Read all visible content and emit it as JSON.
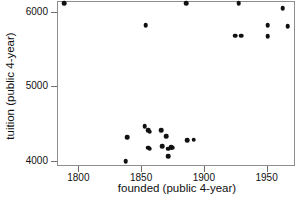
{
  "chart_data": {
    "type": "scatter",
    "title": "",
    "xlabel": "founded (public 4-year)",
    "ylabel": "tuition (public 4-year)",
    "xlim": [
      1783,
      1971
    ],
    "ylim": [
      3955,
      6145
    ],
    "xticks": [
      1800,
      1850,
      1900,
      1950
    ],
    "xtick_labels": [
      "1800",
      "1850",
      "1900",
      "1950"
    ],
    "yticks": [
      4000,
      5000,
      6000
    ],
    "ytick_labels": [
      "4000",
      "5000",
      "6000"
    ],
    "grid": false,
    "legend": null,
    "marker": "filled-circle",
    "marker_color": "#111111",
    "frame_color": "#8e8e8e",
    "background": "#ffffff",
    "n_points": 26,
    "points": [
      {
        "x": 1788,
        "y": 6130
      },
      {
        "x": 1853,
        "y": 5830
      },
      {
        "x": 1885,
        "y": 6125
      },
      {
        "x": 1927,
        "y": 6127
      },
      {
        "x": 1962,
        "y": 6060
      },
      {
        "x": 1950,
        "y": 5830
      },
      {
        "x": 1966,
        "y": 5820
      },
      {
        "x": 1924,
        "y": 5690
      },
      {
        "x": 1929,
        "y": 5690
      },
      {
        "x": 1950,
        "y": 5685
      },
      {
        "x": 1837,
        "y": 4010
      },
      {
        "x": 1838,
        "y": 4330
      },
      {
        "x": 1852,
        "y": 4480
      },
      {
        "x": 1855,
        "y": 4420
      },
      {
        "x": 1856,
        "y": 4405
      },
      {
        "x": 1855,
        "y": 4185
      },
      {
        "x": 1856,
        "y": 4175
      },
      {
        "x": 1865,
        "y": 4420
      },
      {
        "x": 1866,
        "y": 4210
      },
      {
        "x": 1869,
        "y": 4345
      },
      {
        "x": 1871,
        "y": 4175
      },
      {
        "x": 1871,
        "y": 4070
      },
      {
        "x": 1873,
        "y": 4195
      },
      {
        "x": 1874,
        "y": 4185
      },
      {
        "x": 1886,
        "y": 4290
      },
      {
        "x": 1891,
        "y": 4295
      }
    ]
  }
}
